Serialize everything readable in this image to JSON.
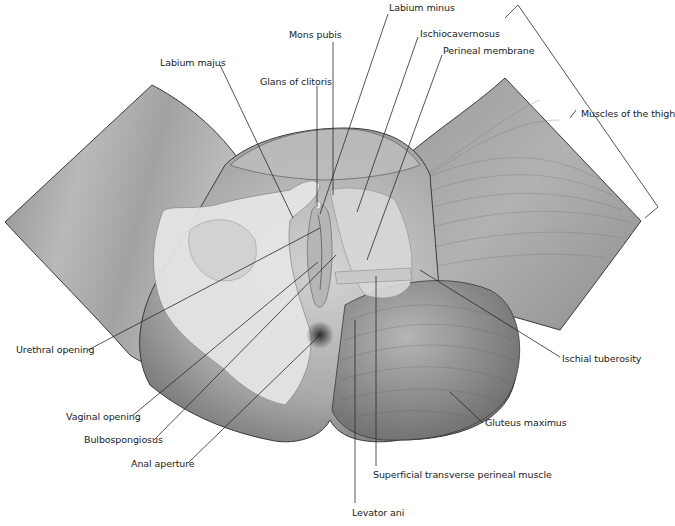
{
  "diagram": {
    "labels": [
      {
        "id": "labium-minus",
        "text": "Labium minus",
        "x": 389,
        "y": 8
      },
      {
        "id": "mons-pubis",
        "text": "Mons pubis",
        "x": 289,
        "y": 33
      },
      {
        "id": "ischiocavernosus",
        "text": "Ischiocavernosus",
        "x": 420,
        "y": 31
      },
      {
        "id": "perineal-membrane",
        "text": "Perineal membrane",
        "x": 443,
        "y": 49
      },
      {
        "id": "labium-majus",
        "text": "Labium majus",
        "x": 160,
        "y": 60
      },
      {
        "id": "glans-of-clitoris",
        "text": "Glans of clitoris",
        "x": 260,
        "y": 79
      },
      {
        "id": "muscles-of-the-thigh",
        "text": "Muscles of the thigh",
        "x": 581,
        "y": 109
      },
      {
        "id": "urethral-opening",
        "text": "Urethral opening",
        "x": 16,
        "y": 344
      },
      {
        "id": "ischial-tuberosity",
        "text": "Ischial tuberosity",
        "x": 562,
        "y": 352
      },
      {
        "id": "vaginal-opening",
        "text": "Vaginal opening",
        "x": 66,
        "y": 412
      },
      {
        "id": "gluteus-maximus",
        "text": "Gluteus maximus",
        "x": 485,
        "y": 419
      },
      {
        "id": "bulbospongiosus",
        "text": "Bulbospongiosus",
        "x": 84,
        "y": 436
      },
      {
        "id": "anal-aperture",
        "text": "Anal aperture",
        "x": 131,
        "y": 458
      },
      {
        "id": "superficial-transverse-perineal-muscle",
        "text": "Superficial transverse perineal muscle",
        "x": 373,
        "y": 469
      },
      {
        "id": "levator-ani",
        "text": "Levator ani",
        "x": 352,
        "y": 507
      }
    ]
  }
}
